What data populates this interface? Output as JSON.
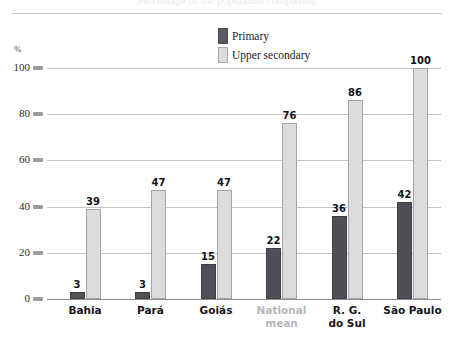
{
  "header": {
    "title_sliver": "Percentage of the population completing",
    "axis_unit_label": "%"
  },
  "legend": {
    "position": "top-center",
    "items": [
      {
        "label": "Primary",
        "color": "#4f4f57",
        "key": "primary"
      },
      {
        "label": "Upper secondary",
        "color": "#dcdcdc",
        "key": "upper_secondary"
      }
    ]
  },
  "chart_data": {
    "type": "bar",
    "title": "",
    "subtitle": "",
    "xlabel": "",
    "ylabel": "%",
    "ylim": [
      0,
      100
    ],
    "yticks": [
      0,
      20,
      40,
      60,
      80,
      100
    ],
    "grid": true,
    "legend_position": "top-center",
    "categories": [
      "Bahia",
      "Pará",
      "Goiás",
      "National mean",
      "R. G. do Sul",
      "São Paulo"
    ],
    "category_lines": [
      [
        "Bahia"
      ],
      [
        "Pará"
      ],
      [
        "Goiás"
      ],
      [
        "National",
        "mean"
      ],
      [
        "R. G.",
        "do Sul"
      ],
      [
        "São Paulo"
      ]
    ],
    "category_muted": [
      false,
      false,
      false,
      true,
      false,
      false
    ],
    "series": [
      {
        "name": "Primary",
        "color": "#4f4f57",
        "values": [
          3,
          3,
          15,
          22,
          36,
          42
        ]
      },
      {
        "name": "Upper secondary",
        "color": "#dcdcdc",
        "values": [
          39,
          47,
          47,
          76,
          86,
          100
        ]
      }
    ]
  },
  "yaxis": {
    "ticks": [
      "100",
      "80",
      "60",
      "40",
      "20",
      "0"
    ]
  }
}
